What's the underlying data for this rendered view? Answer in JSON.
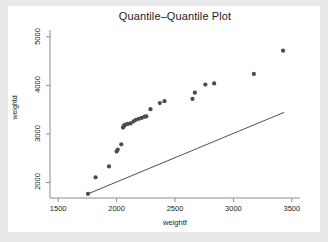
{
  "chart_data": {
    "type": "scatter",
    "title": "Quantile–Quantile Plot",
    "xlabel": "weightf",
    "ylabel": "weightd",
    "xlim": [
      1430,
      3570
    ],
    "ylim": [
      1680,
      5140
    ],
    "xticks": [
      1500,
      2000,
      2500,
      3000,
      3500
    ],
    "yticks": [
      2000,
      3000,
      4000,
      5000
    ],
    "xtick_labels": [
      "1500",
      "2000",
      "2500",
      "3000",
      "3500"
    ],
    "ytick_labels": [
      "2000",
      "3000",
      "4000",
      "5000"
    ],
    "grid": false,
    "legend": null,
    "marker_color": "#4a4a52",
    "line_color": "#3a3a42",
    "background": "#ffffff",
    "figure_background": "#e9e9e9",
    "points": [
      {
        "x": 1755,
        "y": 1765
      },
      {
        "x": 1820,
        "y": 2105
      },
      {
        "x": 1935,
        "y": 2330
      },
      {
        "x": 2000,
        "y": 2640
      },
      {
        "x": 2010,
        "y": 2675
      },
      {
        "x": 2040,
        "y": 2785
      },
      {
        "x": 2055,
        "y": 3130
      },
      {
        "x": 2060,
        "y": 3155
      },
      {
        "x": 2065,
        "y": 3175
      },
      {
        "x": 2075,
        "y": 3190
      },
      {
        "x": 2095,
        "y": 3205
      },
      {
        "x": 2120,
        "y": 3215
      },
      {
        "x": 2145,
        "y": 3260
      },
      {
        "x": 2165,
        "y": 3290
      },
      {
        "x": 2190,
        "y": 3310
      },
      {
        "x": 2215,
        "y": 3330
      },
      {
        "x": 2240,
        "y": 3355
      },
      {
        "x": 2255,
        "y": 3360
      },
      {
        "x": 2290,
        "y": 3510
      },
      {
        "x": 2370,
        "y": 3635
      },
      {
        "x": 2410,
        "y": 3675
      },
      {
        "x": 2650,
        "y": 3720
      },
      {
        "x": 2670,
        "y": 3850
      },
      {
        "x": 2760,
        "y": 4015
      },
      {
        "x": 2835,
        "y": 4040
      },
      {
        "x": 3175,
        "y": 4235
      },
      {
        "x": 3425,
        "y": 4715
      }
    ],
    "reference_line": {
      "description": "45-degree reference line",
      "x_start": 1755,
      "y_start": 1765,
      "x_end": 3435,
      "y_end": 3445
    }
  }
}
